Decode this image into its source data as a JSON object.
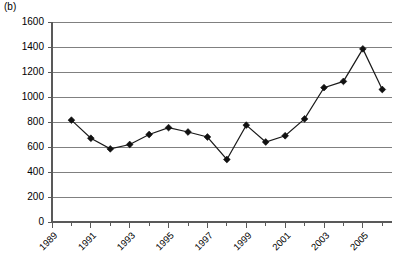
{
  "panel": {
    "label": "(b)"
  },
  "chart_data": {
    "type": "line",
    "title": "",
    "xlabel": "",
    "ylabel": "",
    "x": [
      1990,
      1991,
      1992,
      1993,
      1994,
      1995,
      1996,
      1997,
      1998,
      1999,
      2000,
      2001,
      2002,
      2003,
      2004,
      2005,
      2006
    ],
    "values": [
      815,
      670,
      585,
      620,
      700,
      755,
      720,
      680,
      500,
      775,
      640,
      690,
      825,
      1075,
      1125,
      1385,
      1060
    ],
    "series": [
      {
        "name": "series-1",
        "values": [
          815,
          670,
          585,
          620,
          700,
          755,
          720,
          680,
          500,
          775,
          640,
          690,
          825,
          1075,
          1125,
          1385,
          1060
        ]
      }
    ],
    "xlim": [
      1989,
      2006.5
    ],
    "ylim": [
      0,
      1600
    ],
    "ytick_labels": [
      "0",
      "200",
      "400",
      "600",
      "800",
      "1000",
      "1200",
      "1400",
      "1600"
    ],
    "ytick_values": [
      0,
      200,
      400,
      600,
      800,
      1000,
      1200,
      1400,
      1600
    ],
    "xtick_labels": [
      "1989",
      "1991",
      "1993",
      "1995",
      "1997",
      "1999",
      "2001",
      "2003",
      "2005"
    ],
    "xtick_values": [
      1989,
      1991,
      1993,
      1995,
      1997,
      1999,
      2001,
      2003,
      2005
    ],
    "xminor_values": [
      1990,
      1992,
      1994,
      1996,
      1998,
      2000,
      2002,
      2004,
      2006
    ],
    "grid": "horizontal",
    "legend": "none",
    "marker": "diamond",
    "line_color": "#1a1a1a",
    "grid_color": "#808080",
    "axis_color": "#595959"
  }
}
